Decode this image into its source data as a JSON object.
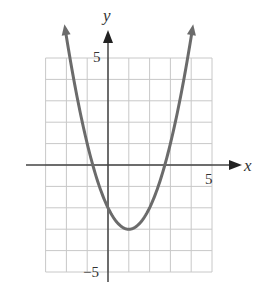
{
  "chart_data": {
    "type": "line",
    "title": "",
    "xlabel": "x",
    "ylabel": "y",
    "function": "y = x^2 - 2x - 2",
    "vertex": [
      1,
      -3
    ],
    "y_intercept": -2,
    "x_intercepts": [
      -0.73,
      2.73
    ],
    "xlim": [
      -3,
      5
    ],
    "ylim": [
      -5,
      5
    ],
    "grid": true,
    "tick_labels": {
      "x": [
        "5"
      ],
      "y": [
        "5",
        "−5"
      ]
    },
    "series": [
      {
        "name": "parabola",
        "x": [
          -2.2,
          -2,
          -1,
          0,
          1,
          2,
          3,
          4,
          4.2
        ],
        "y": [
          7.24,
          6,
          1,
          -2,
          -3,
          -2,
          1,
          6,
          7.24
        ]
      }
    ],
    "curve_arrows": true
  },
  "labels": {
    "x_axis": "x",
    "y_axis": "y",
    "x_tick_5": "5",
    "y_tick_5": "5",
    "y_tick_neg5": "−5"
  }
}
